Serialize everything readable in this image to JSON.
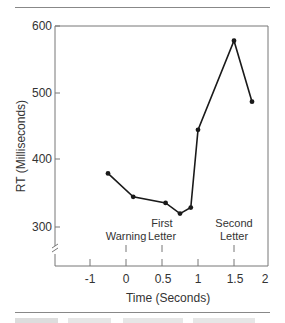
{
  "chart_data": {
    "type": "line",
    "title": "",
    "xlabel": "Time (Seconds)",
    "ylabel": "RT (Milliseconds)",
    "x_tick_labels": [
      "-1",
      "0",
      "0.5",
      "1",
      "1.5",
      "2"
    ],
    "y_tick_labels": [
      "300",
      "400",
      "500",
      "600"
    ],
    "ylim": [
      260,
      600
    ],
    "y_axis_break": true,
    "grid": false,
    "series": [
      {
        "name": "RT",
        "x": [
          -0.25,
          0.1,
          0.55,
          0.75,
          0.9,
          1.0,
          1.5,
          1.75
        ],
        "values": [
          380,
          345,
          336,
          320,
          329,
          445,
          578,
          487
        ]
      }
    ],
    "annotations": [
      {
        "label": "Warning",
        "x": 0
      },
      {
        "label": "First Letter",
        "x": 0.5
      },
      {
        "label": "Second Letter",
        "x": 1.5
      }
    ]
  },
  "labels": {
    "xlabel": "Time (Seconds)",
    "ylabel": "RT (Milliseconds)",
    "xticks": [
      "-1",
      "0",
      "0.5",
      "1",
      "1.5",
      "2"
    ],
    "yticks": [
      "600",
      "500",
      "400",
      "300"
    ],
    "ann_warning": "Warning",
    "ann_first_1": "First",
    "ann_first_2": "Letter",
    "ann_second_1": "Second",
    "ann_second_2": "Letter"
  },
  "colors": {
    "line": "#1a1a1a",
    "axis": "#777777",
    "text": "#333333"
  }
}
